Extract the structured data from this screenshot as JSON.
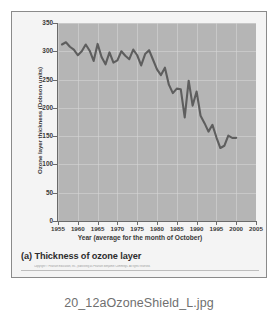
{
  "figure": {
    "caption": "(a) Thickness of ozone layer",
    "copyright": "Copyright © Pearson Education, Inc., publishing as Pearson Benjamin Cummings. All rights reserved.",
    "filename": "20_12aOzoneShield_L.jpg"
  },
  "colors": {
    "plot_background": "#b5b5b5",
    "line": "#5e5e5e",
    "gridline": "#d7d7d7",
    "axis": "#6a6a6a",
    "text": "#3a3a3a",
    "page_background": "#ffffff",
    "frame_border": "#8a8a8a",
    "filename_text": "#6f6f6f"
  },
  "chart_data": {
    "type": "line",
    "title": "(a) Thickness of ozone layer",
    "xlabel": "Year (average for the month of October)",
    "ylabel": "Ozone layer thickness (Dobson units)",
    "xlim": [
      1955,
      2005
    ],
    "ylim": [
      0,
      350
    ],
    "xticks": [
      1955,
      1960,
      1965,
      1970,
      1975,
      1980,
      1985,
      1990,
      1995,
      2000,
      2005
    ],
    "yticks": [
      0,
      50,
      100,
      150,
      200,
      250,
      300,
      350
    ],
    "grid": true,
    "legend": null,
    "series": [
      {
        "name": "Ozone layer thickness",
        "x": [
          1956,
          1957,
          1958,
          1959,
          1960,
          1961,
          1962,
          1963,
          1964,
          1965,
          1966,
          1967,
          1968,
          1969,
          1970,
          1971,
          1972,
          1973,
          1974,
          1975,
          1976,
          1977,
          1978,
          1979,
          1980,
          1981,
          1982,
          1983,
          1984,
          1985,
          1986,
          1987,
          1988,
          1989,
          1990,
          1991,
          1992,
          1993,
          1994,
          1995,
          1996,
          1997,
          1998,
          1999,
          2000
        ],
        "values": [
          312,
          316,
          308,
          303,
          293,
          300,
          312,
          301,
          283,
          313,
          290,
          277,
          298,
          280,
          284,
          300,
          292,
          286,
          303,
          293,
          275,
          295,
          302,
          285,
          268,
          258,
          271,
          241,
          226,
          234,
          233,
          183,
          248,
          204,
          229,
          186,
          173,
          158,
          170,
          148,
          129,
          133,
          151,
          147,
          147
        ]
      }
    ]
  },
  "axis": {
    "y_labels": [
      "350",
      "300",
      "250",
      "200",
      "150",
      "100",
      "50",
      "0"
    ],
    "x_labels": [
      "1955",
      "1960",
      "1965",
      "1970",
      "1975",
      "1980",
      "1985",
      "1990",
      "1995",
      "2000",
      "2005"
    ],
    "y_title": "Ozone layer thickness (Dobson units)",
    "x_title": "Year (average for the month of October)"
  }
}
